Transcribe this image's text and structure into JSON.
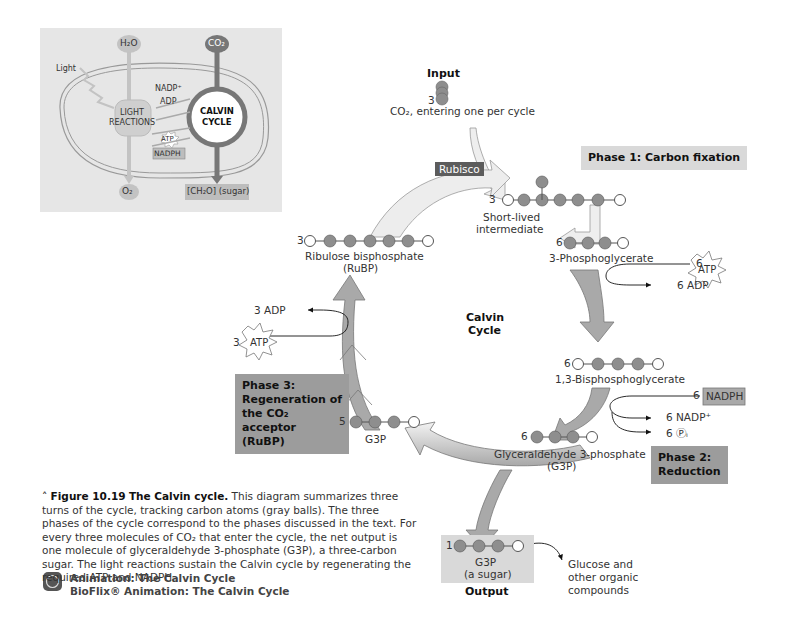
{
  "inset": {
    "h2o": "H₂O",
    "co2": "CO₂",
    "light": "Light",
    "light_reactions": [
      "LIGHT",
      "REACTIONS"
    ],
    "nadp_plus": "NADP⁺",
    "adp": "ADP",
    "atp": "ATP",
    "nadph": "NADPH",
    "calvin_cycle": [
      "CALVIN",
      "CYCLE"
    ],
    "o2": "O₂",
    "sugar": "[CH₂O] (sugar)"
  },
  "input": {
    "title": "Input",
    "count": "3",
    "label": "CO₂, entering one per cycle"
  },
  "enzyme": "Rubisco",
  "phases": {
    "phase1": "Phase 1: Carbon fixation",
    "phase2": [
      "Phase 2:",
      "Reduction"
    ],
    "phase3": [
      "Phase 3:",
      "Regeneration of",
      "the CO₂ acceptor",
      "(RuBP)"
    ]
  },
  "center": [
    "Calvin",
    "Cycle"
  ],
  "molecules": {
    "intermediate": {
      "count": "3",
      "label": [
        "Short-lived",
        "intermediate"
      ]
    },
    "pga": {
      "count": "6",
      "label": "3-Phosphoglycerate"
    },
    "bpg": {
      "count": "6",
      "label": "1,3-Bisphosphoglycerate"
    },
    "g3p6": {
      "count": "6",
      "label": [
        "Glyceraldehyde 3-phosphate",
        "(G3P)"
      ]
    },
    "g3p5": {
      "count": "5",
      "label": "G3P"
    },
    "rubp": {
      "count": "3",
      "label": [
        "Ribulose bisphosphate",
        "(RuBP)"
      ]
    }
  },
  "energy": {
    "atp_in_1": {
      "count": "6",
      "label": "ATP"
    },
    "adp_out_1": "6 ADP",
    "nadph_in": {
      "count": "6",
      "label": "NADPH"
    },
    "nadp_out": "6 NADP⁺",
    "pi_out": "6 Ⓟᵢ",
    "atp_in_3": {
      "count": "3",
      "label": "ATP"
    },
    "adp_out_3": "3 ADP"
  },
  "output": {
    "count": "1",
    "g3p": "G3P",
    "sugar": "(a sugar)",
    "title": "Output",
    "destination": [
      "Glucose and",
      "other organic",
      "compounds"
    ]
  },
  "caption": {
    "figure_label": "Figure 10.19",
    "title": "The Calvin cycle.",
    "body": "This diagram summarizes three turns of the cycle, tracking carbon atoms (gray balls). The three phases of the cycle correspond to the phases discussed in the text. For every three molecules of CO₂ that enter the cycle, the net output is one molecule of glyceraldehyde 3-phosphate (G3P), a three-carbon sugar. The light reactions sustain the Calvin cycle by regenerating the required ATP and NADPH."
  },
  "links": [
    "Animation: The Calvin Cycle",
    "BioFlix® Animation: The Calvin Cycle"
  ],
  "colors": {
    "arrow_fill": "#a9a9a9",
    "arrow_light": "#ececec",
    "ball": "#8e8e8e",
    "phase_light": "#d9d9d9",
    "phase_dark": "#9c9c9c",
    "inset_bg": "#e6e6e6"
  }
}
